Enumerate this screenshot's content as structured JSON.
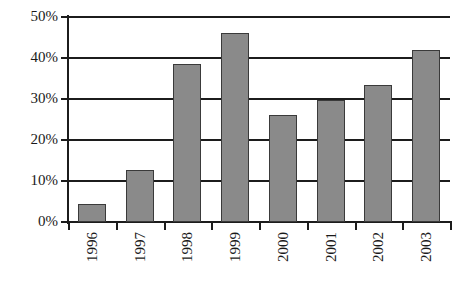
{
  "chart_data": {
    "type": "bar",
    "title": "",
    "subtitle": "",
    "xlabel": "",
    "ylabel": "",
    "categories": [
      "1996",
      "1997",
      "1998",
      "1999",
      "2000",
      "2001",
      "2002",
      "2003"
    ],
    "values": [
      4.3,
      12.7,
      38.5,
      46.0,
      26.0,
      29.8,
      33.5,
      42.0
    ],
    "value_labels": [
      "4.3%",
      "12.7%",
      "38.5%",
      "46%",
      "26%",
      "29.8%",
      "33.5%",
      "42%"
    ],
    "series": [
      {
        "name": "",
        "values": [
          4.3,
          12.7,
          38.5,
          46.0,
          26.0,
          29.8,
          33.5,
          42.0
        ]
      }
    ],
    "ylim": [
      0,
      50
    ],
    "ytick_values": [
      0,
      10,
      20,
      30,
      40,
      50
    ],
    "ytick_labels": [
      "0%",
      "10%",
      "20%",
      "30%",
      "40%",
      "50%"
    ],
    "grid": true,
    "grid_axis": "y",
    "legend": false,
    "legend_position": "none",
    "annotations": [],
    "colors": {
      "bar_fill": "#8a8a8a",
      "bar_edge": "#3a3a3a",
      "axis": "#1c1c1c",
      "gridline": "#1c1c1c",
      "background": "#ffffff",
      "text": "#1a1a1a"
    }
  }
}
